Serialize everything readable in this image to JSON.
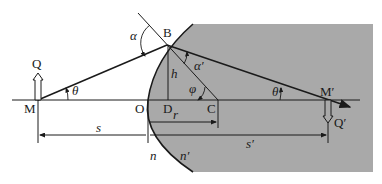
{
  "diagram": {
    "type": "spherical-refracting-surface",
    "colors": {
      "medium_fill": "#a9a9a9",
      "line": "#1a1a1a",
      "background": "#ffffff"
    },
    "points": {
      "M": "M",
      "O": "O",
      "D": "D",
      "C": "C",
      "B": "B",
      "M_prime": "M′",
      "Q": "Q",
      "Q_prime": "Q′"
    },
    "angles": {
      "alpha": "α",
      "alpha_prime": "α′",
      "theta": "θ",
      "theta_prime": "θ′",
      "phi": "φ"
    },
    "lengths": {
      "h": "h",
      "r": "r",
      "s": "s",
      "s_prime": "s′"
    },
    "media": {
      "n": "n",
      "n_prime": "n′"
    }
  }
}
